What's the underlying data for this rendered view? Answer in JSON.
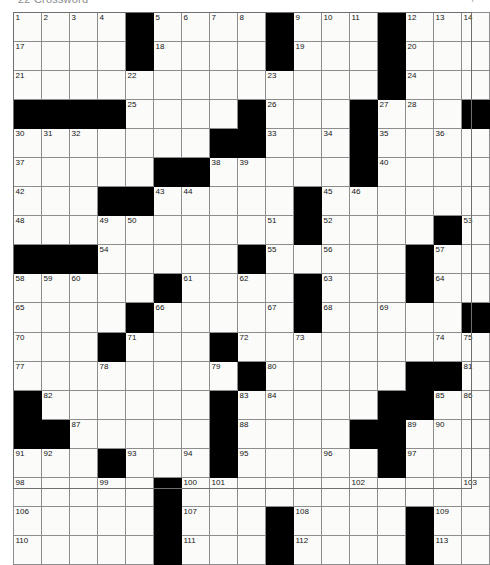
{
  "header": {
    "title": "22  Crossword",
    "right_mark": "P"
  },
  "puzzle": {
    "name": "crossword-grid",
    "columns": 17,
    "rows": 17,
    "cell_fill_color": "#fbfbfa",
    "block_color": "#000000",
    "grid_line_color": "#8d8d8d",
    "number_color": "#141414",
    "max_clue_number": 113,
    "grid": [
      [
        {
          "n": "1"
        },
        {
          "n": "2"
        },
        {
          "n": "3"
        },
        {
          "n": "4"
        },
        {
          "b": 1
        },
        {
          "n": "5"
        },
        {
          "n": "6"
        },
        {
          "n": "7"
        },
        {
          "n": "8"
        },
        {
          "b": 1
        },
        {
          "n": "9"
        },
        {
          "n": "10"
        },
        {
          "n": "11"
        },
        {
          "b": 1
        },
        {
          "n": "12"
        },
        {
          "n": "13"
        },
        {
          "n": "14"
        },
        {
          "n": "15"
        },
        {
          "n": "16"
        }
      ],
      [
        {
          "n": "17"
        },
        {},
        {},
        {},
        {
          "b": 1
        },
        {
          "n": "18"
        },
        {},
        {},
        {},
        {
          "b": 1
        },
        {
          "n": "19"
        },
        {},
        {},
        {
          "b": 1
        },
        {
          "n": "20"
        },
        {},
        {},
        {},
        {}
      ],
      [
        {
          "n": "21"
        },
        {},
        {},
        {},
        {
          "n": "22"
        },
        {},
        {},
        {},
        {},
        {
          "n": "23"
        },
        {},
        {},
        {},
        {
          "b": 1
        },
        {
          "n": "24"
        },
        {},
        {},
        {},
        {}
      ],
      [
        {
          "b": 1
        },
        {
          "b": 1
        },
        {
          "b": 1
        },
        {
          "b": 1
        },
        {
          "n": "25"
        },
        {},
        {},
        {},
        {
          "b": 1
        },
        {
          "n": "26"
        },
        {},
        {},
        {
          "b": 1
        },
        {
          "n": "27"
        },
        {
          "n": "28"
        },
        {},
        {
          "b": 1
        },
        {
          "n": "29"
        },
        {},
        {}
      ],
      [
        {
          "n": "30"
        },
        {
          "n": "31"
        },
        {
          "n": "32"
        },
        {},
        {},
        {},
        {},
        {
          "b": 1
        },
        {
          "b": 1
        },
        {
          "n": "33"
        },
        {},
        {
          "n": "34"
        },
        {
          "b": 1
        },
        {
          "n": "35"
        },
        {},
        {
          "n": "36"
        },
        {},
        {
          "b": 1
        },
        {
          "b": 1
        }
      ],
      [
        {
          "n": "37"
        },
        {},
        {},
        {},
        {},
        {
          "b": 1
        },
        {
          "b": 1
        },
        {
          "n": "38"
        },
        {
          "n": "39"
        },
        {},
        {},
        {},
        {
          "b": 1
        },
        {
          "n": "40"
        },
        {},
        {},
        {},
        {
          "n": "41"
        },
        {
          "b": 1
        }
      ],
      [
        {
          "n": "42"
        },
        {},
        {},
        {
          "b": 1
        },
        {
          "b": 1
        },
        {
          "n": "43"
        },
        {
          "n": "44"
        },
        {},
        {},
        {},
        {
          "b": 1
        },
        {
          "n": "45"
        },
        {
          "n": "46"
        },
        {},
        {},
        {},
        {},
        {},
        {
          "n": "47"
        }
      ],
      [
        {
          "n": "48"
        },
        {},
        {},
        {
          "n": "49"
        },
        {
          "n": "50"
        },
        {},
        {},
        {},
        {},
        {
          "n": "51"
        },
        {
          "b": 1
        },
        {
          "n": "52"
        },
        {},
        {},
        {},
        {
          "b": 1
        },
        {
          "n": "53"
        },
        {},
        {}
      ],
      [
        {
          "b": 1
        },
        {
          "b": 1
        },
        {
          "b": 1
        },
        {
          "n": "54"
        },
        {},
        {},
        {},
        {},
        {
          "b": 1
        },
        {
          "n": "55"
        },
        {},
        {
          "n": "56"
        },
        {},
        {},
        {
          "b": 1
        },
        {
          "n": "57"
        },
        {},
        {},
        {}
      ],
      [
        {
          "n": "58"
        },
        {
          "n": "59"
        },
        {
          "n": "60"
        },
        {},
        {},
        {
          "b": 1
        },
        {
          "n": "61"
        },
        {},
        {
          "n": "62"
        },
        {},
        {
          "b": 1
        },
        {
          "n": "63"
        },
        {},
        {},
        {
          "b": 1
        },
        {
          "n": "64"
        },
        {},
        {},
        {}
      ],
      [
        {
          "n": "65"
        },
        {},
        {},
        {},
        {
          "b": 1
        },
        {
          "n": "66"
        },
        {},
        {},
        {},
        {
          "n": "67"
        },
        {
          "b": 1
        },
        {
          "n": "68"
        },
        {},
        {
          "n": "69"
        },
        {},
        {},
        {
          "b": 1
        },
        {
          "b": 1
        },
        {
          "b": 1
        }
      ],
      [
        {
          "n": "70"
        },
        {},
        {},
        {
          "b": 1
        },
        {
          "n": "71"
        },
        {},
        {},
        {
          "b": 1
        },
        {
          "n": "72"
        },
        {},
        {
          "n": "73"
        },
        {},
        {},
        {},
        {},
        {
          "n": "74"
        },
        {
          "n": "75"
        },
        {
          "n": "76"
        },
        {}
      ],
      [
        {
          "n": "77"
        },
        {},
        {},
        {
          "n": "78"
        },
        {},
        {},
        {},
        {
          "n": "79"
        },
        {
          "b": 1
        },
        {
          "n": "80"
        },
        {},
        {},
        {},
        {},
        {
          "b": 1
        },
        {
          "b": 1
        },
        {
          "n": "81"
        },
        {},
        {}
      ],
      [
        {
          "b": 1
        },
        {
          "n": "82"
        },
        {},
        {},
        {},
        {},
        {},
        {
          "b": 1
        },
        {
          "n": "83"
        },
        {
          "n": "84"
        },
        {},
        {},
        {},
        {
          "b": 1
        },
        {
          "b": 1
        },
        {
          "n": "85"
        },
        {
          "n": "86"
        },
        {},
        {}
      ],
      [
        {
          "b": 1
        },
        {
          "b": 1
        },
        {
          "n": "87"
        },
        {},
        {},
        {},
        {},
        {
          "b": 1
        },
        {
          "n": "88"
        },
        {},
        {},
        {},
        {
          "b": 1
        },
        {
          "b": 1
        },
        {
          "n": "89"
        },
        {
          "n": "90"
        },
        {},
        {},
        {}
      ],
      [
        {
          "n": "91"
        },
        {
          "n": "92"
        },
        {},
        {
          "b": 1
        },
        {
          "n": "93"
        },
        {},
        {
          "n": "94"
        },
        {
          "b": 1
        },
        {
          "n": "95"
        },
        {},
        {},
        {
          "n": "96"
        },
        {},
        {
          "b": 1
        },
        {
          "n": "97"
        },
        {},
        {},
        {},
        {}
      ],
      [
        {
          "n": "98"
        },
        {},
        {},
        {
          "n": "99"
        },
        {},
        {
          "b": 1
        },
        {
          "n": "100"
        },
        {
          "n": "101"
        },
        {},
        {},
        {},
        {},
        {
          "n": "102"
        },
        {},
        {},
        {},
        {
          "n": "103"
        },
        {
          "n": "104"
        },
        {
          "n": "105"
        }
      ],
      [
        {
          "n": "106"
        },
        {},
        {},
        {},
        {},
        {
          "b": 1
        },
        {
          "n": "107"
        },
        {},
        {},
        {
          "b": 1
        },
        {
          "n": "108"
        },
        {},
        {},
        {},
        {
          "b": 1
        },
        {
          "n": "109"
        },
        {},
        {},
        {}
      ],
      [
        {
          "n": "110"
        },
        {},
        {},
        {},
        {},
        {
          "b": 1
        },
        {
          "n": "111"
        },
        {},
        {},
        {
          "b": 1
        },
        {
          "n": "112"
        },
        {},
        {},
        {},
        {
          "b": 1
        },
        {
          "n": "113"
        },
        {},
        {},
        {}
      ]
    ]
  }
}
